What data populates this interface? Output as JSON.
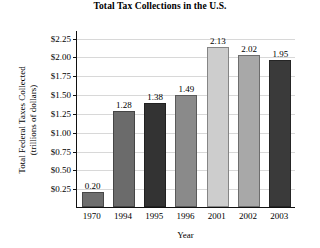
{
  "chart_data": {
    "type": "bar",
    "title": "Total Tax Collections in the U.S.",
    "xlabel": "Year",
    "ylabel_line1": "Total Federal Taxes Collected",
    "ylabel_line2": "(trillions of dollars)",
    "categories": [
      "1970",
      "1994",
      "1995",
      "1996",
      "2001",
      "2002",
      "2003"
    ],
    "values": [
      0.2,
      1.28,
      1.38,
      1.49,
      2.13,
      2.02,
      1.95
    ],
    "value_labels": [
      "0.20",
      "1.28",
      "1.38",
      "1.49",
      "2.13",
      "2.02",
      "1.95"
    ],
    "bar_colors": [
      "#6e6e6e",
      "#6b6b6b",
      "#333333",
      "#8a8a8a",
      "#cdcdcd",
      "#a8a8a8",
      "#3a3a3a"
    ],
    "ylim": [
      0.0,
      2.35
    ],
    "yticks": [
      0.25,
      0.5,
      0.75,
      1.0,
      1.25,
      1.5,
      1.75,
      2.0,
      2.25
    ],
    "ytick_labels": [
      "$0.25",
      "$0.50",
      "$0.75",
      "$1.00",
      "$1.25",
      "$1.50",
      "$1.75",
      "$2.00",
      "$2.25"
    ],
    "grid": true,
    "legend": "none",
    "gridline_color": "#d8d8d8",
    "axis_color": "#111111",
    "background": "#ffffff"
  }
}
